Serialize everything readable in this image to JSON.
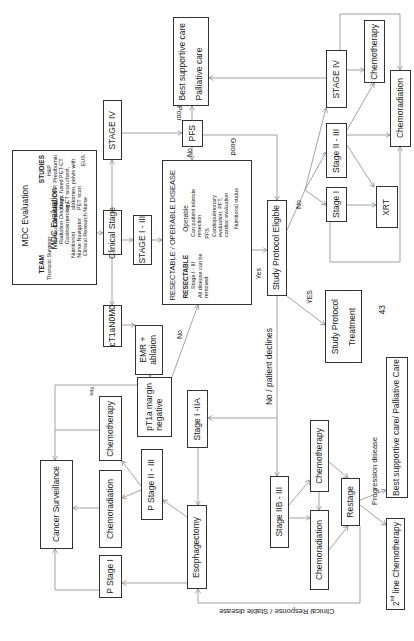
{
  "diagram": {
    "page_number": "43",
    "mdc": {
      "title": "MDC Evaluation",
      "team_header": "TEAM",
      "team": [
        "Thoracic Surgeon",
        "Medical Oncology",
        "Radiation Oncology",
        "Gastroenterology",
        "Nutritionist",
        "Nurse Navigator",
        "Clinical Research Nurse"
      ],
      "studies_header": "STUDIES",
      "studies": [
        "H&P",
        "Labs: CBC, CMP, Prealbumin",
        "Xrays: fused PET-CT or CT scan chest, abdomen, pelvis with PET scan",
        "EUS"
      ]
    },
    "nodes": {
      "clinical_stage": "Clinical Stage",
      "stage_iv_left": "STAGE IV",
      "stage_i_iii": "STAGE I - III",
      "ct1an0m0": "cT1aN0M0",
      "emr": [
        "EMR +",
        "ablation"
      ],
      "pt1a": [
        "pT1a margin",
        "negative"
      ],
      "pfs": "PFS",
      "bsc_top": [
        "Best supportive care",
        "Palliative care"
      ],
      "study_eligible": "Study Protocol Eligible",
      "study_treatment": [
        "Study Protocol",
        "Treatment"
      ],
      "stage_i_right": "Stage I",
      "stage_ii_iii_right": "Stage II - III",
      "stage_iv_right": "STAGE IV",
      "chemo_right": "Chemotherapy",
      "chemorad_right": "Chemoradiation",
      "xrt": "XRT",
      "stage_i_iia": "Stage I -IIA",
      "esophagectomy": "Esophagectomy",
      "p_stage_i": "P Stage I",
      "p_stage_ii_iii": "P Stage II - III",
      "chemo_left": "Chemotherapy",
      "chemorad_left": "Chemoradiation",
      "cancer_surveillance": "Cancer Surveillance",
      "stage_iib_iii": "Stage IIB - III",
      "chemo_bottom": "Chemotherapy",
      "chemorad_bottom": "Chemoradiation",
      "restage": "Restage",
      "second_line_pre": "2",
      "second_line_sup": "nd",
      "second_line_post": " line Chemotherapy",
      "bsc_bottom": "Best supportive care/ Palliative Care"
    },
    "resectable": {
      "title": "RESECTABLE / OPERABLE DISEASE",
      "resectable_header": "RESECTABLE",
      "resectable_items": [
        "Stage I - III",
        "All disease can be removed"
      ],
      "operable_header": "Operable",
      "operable_items": [
        "Can patient tolerate resection",
        "PFS",
        "Cardiopulmonary evaluation: PFT, cardiac evaluation",
        "Nutritional status"
      ]
    },
    "labels": {
      "poor": "Poor",
      "good": "Good",
      "no_pfs": "No",
      "no_emr": "No",
      "yes_pt1a": "Yes",
      "yes_resectable": "Yes",
      "no_study": "No",
      "yes_study": "YES",
      "no_patient_declines": "No / patient declines",
      "progression": "Progression disease",
      "clinical_response": "Clinical Response / Stable disease"
    }
  }
}
